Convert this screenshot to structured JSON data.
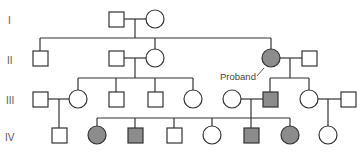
{
  "colors": {
    "line": "#333333",
    "unaffected": "#ffffff",
    "affected": "#8c8c8c"
  },
  "generations": [
    {
      "label": "I",
      "y": 20
    },
    {
      "label": "II",
      "y": 60
    },
    {
      "label": "III",
      "y": 100
    },
    {
      "label": "IV",
      "y": 137
    }
  ],
  "proband_label": "Proband",
  "individuals": [
    {
      "id": "I-1",
      "sex": "male",
      "affected": false,
      "x": 116,
      "y": 19
    },
    {
      "id": "I-2",
      "sex": "female",
      "affected": false,
      "x": 155,
      "y": 19
    },
    {
      "id": "II-1",
      "sex": "male",
      "affected": false,
      "x": 40,
      "y": 58
    },
    {
      "id": "II-2",
      "sex": "male",
      "affected": false,
      "x": 116,
      "y": 58
    },
    {
      "id": "II-3",
      "sex": "female",
      "affected": false,
      "x": 155,
      "y": 58
    },
    {
      "id": "II-4",
      "sex": "female",
      "affected": true,
      "x": 271,
      "y": 58,
      "proband": true
    },
    {
      "id": "II-5",
      "sex": "male",
      "affected": false,
      "x": 309,
      "y": 58
    },
    {
      "id": "III-1",
      "sex": "male",
      "affected": false,
      "x": 40,
      "y": 99
    },
    {
      "id": "III-2",
      "sex": "female",
      "affected": false,
      "x": 78,
      "y": 99
    },
    {
      "id": "III-3",
      "sex": "male",
      "affected": false,
      "x": 116,
      "y": 99
    },
    {
      "id": "III-4",
      "sex": "male",
      "affected": false,
      "x": 155,
      "y": 99
    },
    {
      "id": "III-5",
      "sex": "female",
      "affected": false,
      "x": 193,
      "y": 99
    },
    {
      "id": "III-6",
      "sex": "female",
      "affected": false,
      "x": 232,
      "y": 99
    },
    {
      "id": "III-7",
      "sex": "male",
      "affected": true,
      "x": 270,
      "y": 99
    },
    {
      "id": "III-8",
      "sex": "female",
      "affected": false,
      "x": 309,
      "y": 99
    },
    {
      "id": "III-9",
      "sex": "male",
      "affected": false,
      "x": 348,
      "y": 99
    },
    {
      "id": "IV-1",
      "sex": "male",
      "affected": false,
      "x": 59,
      "y": 135
    },
    {
      "id": "IV-2",
      "sex": "female",
      "affected": true,
      "x": 97,
      "y": 135
    },
    {
      "id": "IV-3",
      "sex": "male",
      "affected": true,
      "x": 135,
      "y": 135
    },
    {
      "id": "IV-4",
      "sex": "male",
      "affected": false,
      "x": 174,
      "y": 135
    },
    {
      "id": "IV-5",
      "sex": "female",
      "affected": false,
      "x": 212,
      "y": 135
    },
    {
      "id": "IV-6",
      "sex": "male",
      "affected": true,
      "x": 251,
      "y": 135
    },
    {
      "id": "IV-7",
      "sex": "female",
      "affected": true,
      "x": 290,
      "y": 135
    },
    {
      "id": "IV-8",
      "sex": "female",
      "affected": false,
      "x": 328,
      "y": 135
    }
  ]
}
